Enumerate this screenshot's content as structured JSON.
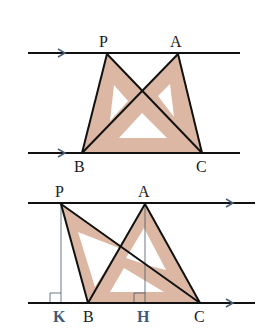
{
  "colors": {
    "line": "#111111",
    "fill": "#dcb8a4",
    "arrow": "#4a6078",
    "foot_label": "#3d5a78",
    "thin": "#445566"
  },
  "figure1": {
    "labels": {
      "P": "P",
      "A": "A",
      "B": "B",
      "C": "C"
    },
    "points": {
      "P": [
        107,
        54
      ],
      "A": [
        178,
        54
      ],
      "B": [
        82,
        153
      ],
      "C": [
        202,
        153
      ]
    },
    "parallel_lines": [
      {
        "y": 53,
        "x1": 28,
        "x2": 240
      },
      {
        "y": 153,
        "x1": 28,
        "x2": 240
      }
    ],
    "triangles": [
      "PBC",
      "ABC"
    ]
  },
  "figure2": {
    "labels": {
      "P": "P",
      "A": "A",
      "B": "B",
      "C": "C",
      "K": "K",
      "H": "H"
    },
    "points": {
      "P": [
        61,
        204
      ],
      "A": [
        145,
        204
      ],
      "B": [
        88,
        303
      ],
      "C": [
        200,
        303
      ],
      "K": [
        61,
        303
      ],
      "H": [
        145,
        303
      ]
    },
    "parallel_lines": [
      {
        "y": 203,
        "x1": 28,
        "x2": 255
      },
      {
        "y": 303,
        "x1": 28,
        "x2": 255
      }
    ],
    "triangles": [
      "PBC",
      "ABC"
    ],
    "altitudes": [
      "PK",
      "AH"
    ],
    "right_angles": [
      "K",
      "H"
    ]
  }
}
